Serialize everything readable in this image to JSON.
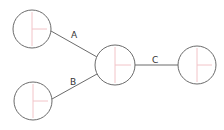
{
  "diagram": {
    "type": "node-link graph",
    "colors": {
      "stroke": "#6b6b6b",
      "crosshair": "#f2c4c8",
      "label": "#333333",
      "background": "#ffffff"
    },
    "nodes": [
      {
        "id": "n1",
        "cx": 32,
        "cy": 29,
        "r": 19
      },
      {
        "id": "n2",
        "cx": 33,
        "cy": 101,
        "r": 19
      },
      {
        "id": "n3",
        "cx": 115,
        "cy": 65,
        "r": 20
      },
      {
        "id": "n4",
        "cx": 197,
        "cy": 65,
        "r": 19
      }
    ],
    "edges": [
      {
        "from": "n1",
        "to": "n3",
        "label": "A",
        "x1": 51,
        "y1": 31,
        "x2": 97,
        "y2": 57,
        "lx": 71,
        "ly": 38
      },
      {
        "from": "n2",
        "to": "n3",
        "label": "B",
        "x1": 52,
        "y1": 99,
        "x2": 97,
        "y2": 74,
        "lx": 70,
        "ly": 85
      },
      {
        "from": "n3",
        "to": "n4",
        "label": "C",
        "x1": 135,
        "y1": 65,
        "x2": 178,
        "y2": 65,
        "lx": 152,
        "ly": 63
      }
    ]
  }
}
